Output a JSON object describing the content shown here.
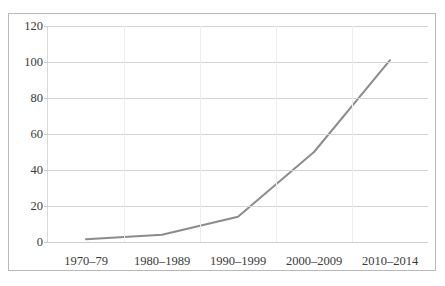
{
  "page": {
    "top_remnant_text": "·    ··"
  },
  "chart_data": {
    "type": "line",
    "title": "",
    "subtitle": "",
    "xlabel": "",
    "ylabel": "",
    "categories": [
      "1970–79",
      "1980–1989",
      "1990–1999",
      "2000–2009",
      "2010–2014"
    ],
    "series": [
      {
        "name": "",
        "values": [
          1.5,
          4,
          14,
          50,
          101
        ]
      }
    ],
    "ylim": [
      0,
      120
    ],
    "yticks": [
      0,
      20,
      40,
      60,
      80,
      100,
      120
    ],
    "ytick_labels": [
      "0",
      "20",
      "40",
      "60",
      "80",
      "100",
      "120"
    ],
    "grid": "horizontal",
    "legend": "none",
    "line_color": "#8c8c8c",
    "grid_color": "#d4d4d4",
    "border_color": "#b9b9b9",
    "text_color": "#3a3a3a",
    "markers": false,
    "line_width": 2
  }
}
